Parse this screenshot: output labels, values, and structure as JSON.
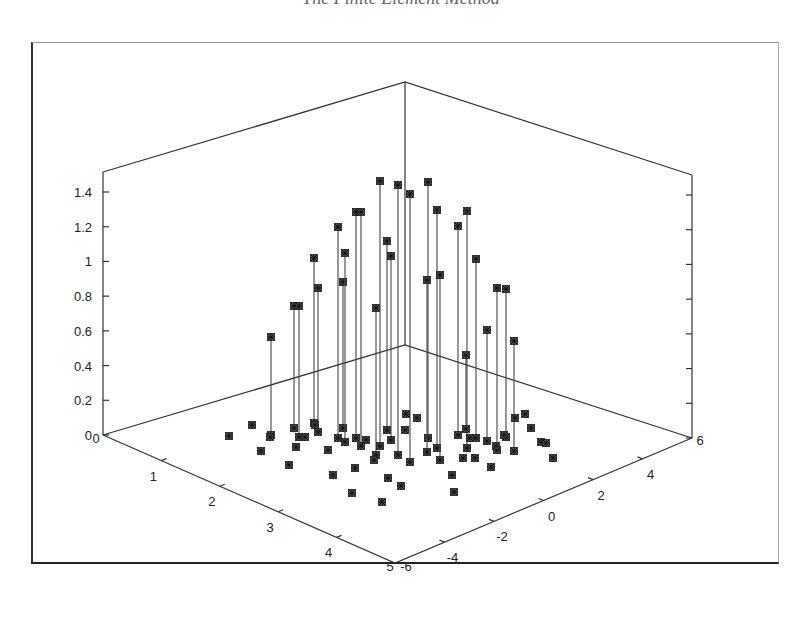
{
  "title": "The Finite Element Method",
  "chart_data": {
    "type": "stem3d",
    "title": "The Finite Element Method",
    "xlabel": "",
    "ylabel": "",
    "zlabel": "",
    "x_axis": {
      "ticks": [
        0,
        1,
        2,
        3,
        4,
        5
      ],
      "range": [
        0,
        5
      ]
    },
    "y_axis": {
      "ticks": [
        -6,
        -4,
        -2,
        0,
        2,
        4,
        6
      ],
      "range": [
        -6,
        6
      ]
    },
    "z_axis": {
      "ticks": [
        0,
        0.2,
        0.4,
        0.6,
        0.8,
        1,
        1.2,
        1.4
      ],
      "range": [
        0,
        1.5
      ]
    },
    "marker": "asterisk-square",
    "grid": false,
    "legend": null,
    "points_screen_estimate": [
      {
        "sx": 271,
        "base": 435,
        "top": 337,
        "z": 0.57
      },
      {
        "sx": 294,
        "base": 428,
        "top": 306,
        "z": 0.7
      },
      {
        "sx": 299,
        "base": 437,
        "top": 306,
        "z": 0.75
      },
      {
        "sx": 314,
        "base": 423,
        "top": 258,
        "z": 0.95
      },
      {
        "sx": 318,
        "base": 432,
        "top": 288,
        "z": 0.84
      },
      {
        "sx": 338,
        "base": 438,
        "top": 227,
        "z": 1.21
      },
      {
        "sx": 343,
        "base": 428,
        "top": 282,
        "z": 0.84
      },
      {
        "sx": 345,
        "base": 442,
        "top": 253,
        "z": 1.09
      },
      {
        "sx": 356,
        "base": 438,
        "top": 212,
        "z": 1.3
      },
      {
        "sx": 361,
        "base": 446,
        "top": 212,
        "z": 1.35
      },
      {
        "sx": 376,
        "base": 455,
        "top": 308,
        "z": 0.84
      },
      {
        "sx": 380,
        "base": 446,
        "top": 181,
        "z": 1.46
      },
      {
        "sx": 387,
        "base": 430,
        "top": 241,
        "z": 1.09
      },
      {
        "sx": 391,
        "base": 440,
        "top": 256,
        "z": 1.06
      },
      {
        "sx": 398,
        "base": 455,
        "top": 185,
        "z": 1.56
      },
      {
        "sx": 410,
        "base": 462,
        "top": 194,
        "z": 1.54
      },
      {
        "sx": 428,
        "base": 438,
        "top": 182,
        "z": 1.46
      },
      {
        "sx": 427,
        "base": 452,
        "top": 280,
        "z": 0.99
      },
      {
        "sx": 437,
        "base": 448,
        "top": 210,
        "z": 1.37
      },
      {
        "sx": 440,
        "base": 460,
        "top": 275,
        "z": 1.06
      },
      {
        "sx": 458,
        "base": 435,
        "top": 226,
        "z": 1.21
      },
      {
        "sx": 467,
        "base": 448,
        "top": 211,
        "z": 1.37
      },
      {
        "sx": 476,
        "base": 438,
        "top": 259,
        "z": 1.03
      },
      {
        "sx": 497,
        "base": 450,
        "top": 288,
        "z": 0.93
      },
      {
        "sx": 506,
        "base": 437,
        "top": 289,
        "z": 0.86
      },
      {
        "sx": 514,
        "base": 451,
        "top": 341,
        "z": 0.63
      },
      {
        "sx": 466,
        "base": 429,
        "top": 355,
        "z": 0.43
      },
      {
        "sx": 487,
        "base": 441,
        "top": 330,
        "z": 0.64
      }
    ],
    "base_only_points": 34
  },
  "axis_labels": {
    "z": [
      "0",
      "0.2",
      "0.4",
      "0.6",
      "0.8",
      "1",
      "1.2",
      "1.4"
    ],
    "x": [
      "0",
      "1",
      "2",
      "3",
      "4",
      "5"
    ],
    "y": [
      "-6",
      "-4",
      "-2",
      "0",
      "2",
      "4",
      "6"
    ]
  },
  "colors": {
    "axis": "#333333",
    "stem": "#444444",
    "marker": "#222222",
    "background": "#ffffff"
  }
}
